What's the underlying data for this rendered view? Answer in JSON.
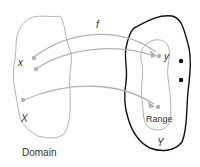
{
  "diagram": {
    "function_label": "f",
    "domain": {
      "element_label": "x",
      "set_label": "X",
      "caption": "Domain"
    },
    "codomain": {
      "element_label": "y",
      "set_label": "Y",
      "range_label": "Range"
    },
    "colors": {
      "domain_outline": "#b3b3b3",
      "codomain_outline": "#111111",
      "range_outline": "#b3b3b3",
      "arrows": "#b3b3b3",
      "points": "#b3b3b3",
      "extra_points": "#111111",
      "text": "#333333"
    }
  }
}
